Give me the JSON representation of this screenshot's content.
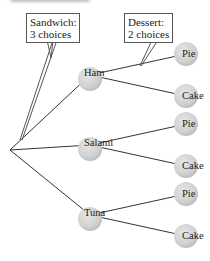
{
  "callouts": {
    "sandwich": {
      "line1": "Sandwich:",
      "line2": "3 choices"
    },
    "dessert": {
      "line1": "Dessert:",
      "line2": "2 choices"
    }
  },
  "sandwiches": [
    {
      "label": "Ham",
      "desserts": [
        "Pie",
        "Cake"
      ]
    },
    {
      "label": "Salami",
      "desserts": [
        "Pie",
        "Cake"
      ]
    },
    {
      "label": "Tuna",
      "desserts": [
        "Pie",
        "Cake"
      ]
    }
  ],
  "colors": {
    "node_fill": "#d4d4d4",
    "node_shade": "#b9b9b9",
    "line": "#333333"
  }
}
